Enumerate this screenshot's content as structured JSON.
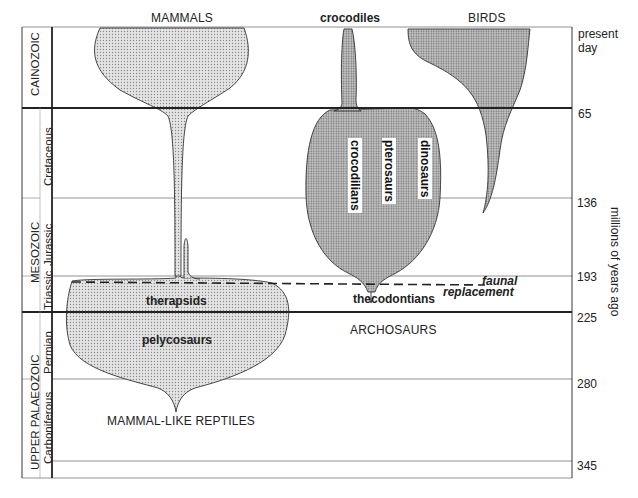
{
  "diagram": {
    "type": "spindle / balloon phylogeny diagram of amniote groups over geological time",
    "group_labels": {
      "mammals": "MAMMALS",
      "crocodiles": "crocodiles",
      "birds": "BIRDS",
      "archosaurs": "ARCHOSAURS",
      "mammal_like_reptiles": "MAMMAL-LIKE REPTILES"
    },
    "clade_labels": {
      "therapsids": "therapsids",
      "pelycosaurs": "pelycosaurs",
      "thecodontians": "thecodontians",
      "crocodilians": "crocodilians",
      "pterosaurs": "pterosaurs",
      "dinosaurs": "dinosaurs"
    },
    "annotation": {
      "line1": "faunal",
      "line2": "replacement"
    },
    "eras": [
      {
        "name": "CAINOZOIC"
      },
      {
        "name": "MESOZOIC"
      },
      {
        "name": "UPPER PALAEOZOIC"
      }
    ],
    "periods": [
      {
        "name": "Cretaceous"
      },
      {
        "name": "Jurassic"
      },
      {
        "name": "Triassic"
      },
      {
        "name": "Permian"
      },
      {
        "name": "Carboniferous"
      }
    ],
    "time_axis": {
      "title": "millions of years ago",
      "ticks": [
        {
          "label": "present",
          "label2": "day"
        },
        {
          "label": "65"
        },
        {
          "label": "136"
        },
        {
          "label": "193"
        },
        {
          "label": "225"
        },
        {
          "label": "280"
        },
        {
          "label": "345"
        }
      ]
    }
  }
}
